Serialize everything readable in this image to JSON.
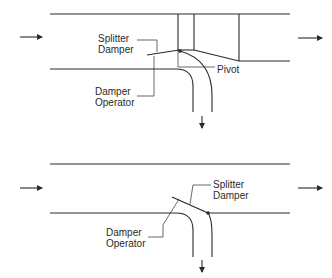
{
  "diagrams": [
    {
      "name": "top-configuration",
      "labels": {
        "splitter_line1": "Splitter",
        "splitter_line2": "Damper",
        "operator_line1": "Damper",
        "operator_line2": "Operator",
        "pivot": "Pivot"
      },
      "flow_arrows": [
        "inlet-right",
        "outlet-right",
        "branch-down"
      ]
    },
    {
      "name": "bottom-configuration",
      "labels": {
        "splitter_line1": "Splitter",
        "splitter_line2": "Damper",
        "operator_line1": "Damper",
        "operator_line2": "Operator"
      },
      "flow_arrows": [
        "inlet-right",
        "outlet-right",
        "branch-down"
      ]
    }
  ],
  "colors": {
    "line": "#2a2a2a",
    "background": "#ffffff"
  }
}
